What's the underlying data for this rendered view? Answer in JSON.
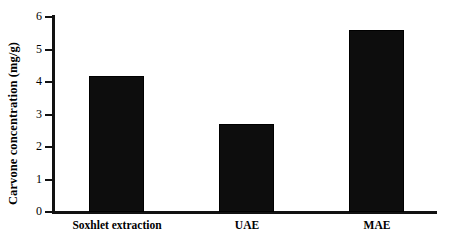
{
  "chart_data": {
    "type": "bar",
    "title": "",
    "subtitle": "",
    "xlabel": "",
    "ylabel": "Carvone concentration  (mg/g)",
    "categories": [
      "Soxhlet extraction",
      "UAE",
      "MAE"
    ],
    "values": [
      4.2,
      2.7,
      5.6
    ],
    "series": [
      {
        "name": "Carvone concentration",
        "values": [
          4.2,
          2.7,
          5.6
        ]
      }
    ],
    "ylim": [
      0,
      6
    ],
    "ytick_labels": [
      "0",
      "1",
      "2",
      "3",
      "4",
      "5",
      "6"
    ],
    "ytick_values": [
      0,
      1,
      2,
      3,
      4,
      5,
      6
    ],
    "grid": false,
    "legend": false,
    "legend_position": "none",
    "bar_color": "#0d0d0d",
    "axis_color": "#111111",
    "background_color": "#ffffff"
  }
}
